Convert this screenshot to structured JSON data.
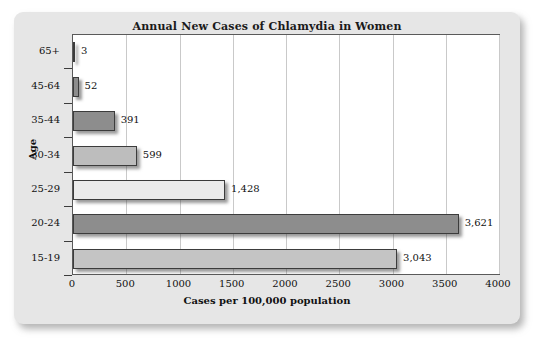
{
  "chart_data": {
    "type": "bar",
    "orientation": "horizontal",
    "title": "Annual New Cases of Chlamydia in Women",
    "xlabel": "Cases per 100,000 population",
    "ylabel": "Age",
    "categories": [
      "65+",
      "45-64",
      "35-44",
      "30-34",
      "25-29",
      "20-24",
      "15-19"
    ],
    "values": [
      3,
      52,
      391,
      599,
      1428,
      3621,
      3043
    ],
    "value_labels": [
      "3",
      "52",
      "391",
      "599",
      "1,428",
      "3,621",
      "3,043"
    ],
    "xlim": [
      0,
      4000
    ],
    "xticks": [
      0,
      500,
      1000,
      1500,
      2000,
      2500,
      3000,
      3500,
      4000
    ],
    "xtick_labels": [
      "0",
      "500",
      "1000",
      "1500",
      "2000",
      "2500",
      "3000",
      "3500",
      "4000"
    ],
    "grid": "vertical",
    "legend": "none",
    "bar_colors": [
      "#8d8d8d",
      "#8d8d8d",
      "#8d8d8d",
      "#bdbdbd",
      "#ececec",
      "#8d8d8d",
      "#c4c4c4"
    ],
    "colors": {
      "card_background": "#e6e6e6",
      "plot_background": "#ffffff",
      "axis": "#3c3c3c",
      "gridline": "#c9c9c9",
      "text": "#111111"
    }
  }
}
